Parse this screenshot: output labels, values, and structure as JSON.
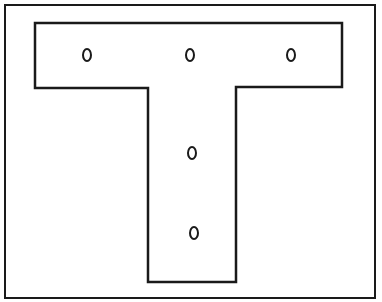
{
  "diagram": {
    "stroke_color": "#1a1a1a",
    "background": "#ffffff",
    "frame": {
      "x": 5,
      "y": 5,
      "width": 370,
      "height": 293
    },
    "t_shape": {
      "points": "35,23 342,23 342,87 236,87 236,282 148,282 148,88 35,88"
    },
    "holes": [
      {
        "name": "hole-top-left",
        "cx": 87,
        "cy": 55,
        "rx": 4,
        "ry": 6
      },
      {
        "name": "hole-top-center",
        "cx": 190,
        "cy": 55,
        "rx": 4,
        "ry": 6
      },
      {
        "name": "hole-top-right",
        "cx": 291,
        "cy": 55,
        "rx": 4,
        "ry": 6
      },
      {
        "name": "hole-stem-upper",
        "cx": 192,
        "cy": 153,
        "rx": 4,
        "ry": 6
      },
      {
        "name": "hole-stem-lower",
        "cx": 194,
        "cy": 233,
        "rx": 4,
        "ry": 6
      }
    ]
  }
}
